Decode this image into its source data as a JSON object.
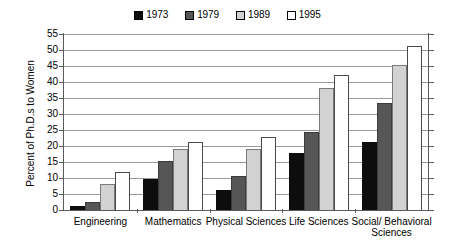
{
  "chart_data": {
    "type": "bar",
    "title": "",
    "subtitle": "",
    "xlabel": "",
    "ylabel": "Percent of Ph.D.s to Women",
    "ylim": [
      0,
      55
    ],
    "ytick_step": 5,
    "yticks": [
      "55",
      "50",
      "45",
      "40",
      "35",
      "30",
      "25",
      "20",
      "15",
      "10",
      "5",
      "0"
    ],
    "grid": true,
    "legend_position": "top-center",
    "categories": [
      "Engineering",
      "Mathematics",
      "Physical Sciences",
      "Life Sciences",
      "Social/ Behavioral Sciences"
    ],
    "series": [
      {
        "name": "1973",
        "color": "#0d0d0d",
        "values": [
          1.2,
          9.8,
          6.3,
          17.8,
          21.1
        ]
      },
      {
        "name": "1979",
        "color": "#565656",
        "values": [
          2.6,
          15.3,
          10.5,
          24.3,
          33.5
        ]
      },
      {
        "name": "1989",
        "color": "#d2d2d2",
        "values": [
          8.2,
          19.0,
          19.2,
          38.2,
          45.2
        ]
      },
      {
        "name": "1995",
        "color": "#ffffff",
        "values": [
          11.8,
          21.3,
          22.8,
          42.2,
          51.2
        ]
      }
    ]
  },
  "legend": {
    "entries": [
      {
        "label": "1973",
        "color": "#0d0d0d"
      },
      {
        "label": "1979",
        "color": "#565656"
      },
      {
        "label": "1989",
        "color": "#d2d2d2"
      },
      {
        "label": "1995",
        "color": "#ffffff"
      }
    ]
  },
  "axis": {
    "y_title": "Percent of Ph.D.s to Women"
  }
}
